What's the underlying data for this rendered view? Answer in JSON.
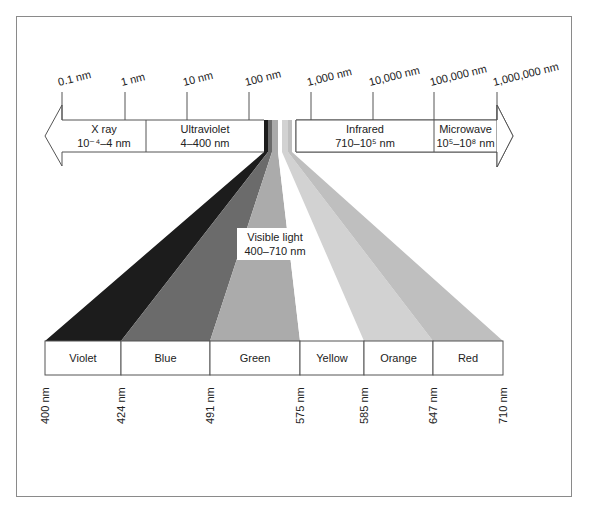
{
  "diagram": {
    "scale_ticks": [
      {
        "label": "0.1 nm",
        "x": 62
      },
      {
        "label": "1 nm",
        "x": 125
      },
      {
        "label": "10 nm",
        "x": 187
      },
      {
        "label": "100 nm",
        "x": 249
      },
      {
        "label": "1,000 nm",
        "x": 311
      },
      {
        "label": "10,000 nm",
        "x": 373
      },
      {
        "label": "100,000 nm",
        "x": 434
      },
      {
        "label": "1,000,000 nm",
        "x": 497
      }
    ],
    "bands": [
      {
        "name": "X ray",
        "range": "10⁻⁴–4 nm",
        "x0": 62,
        "x1": 146
      },
      {
        "name": "Ultraviolet",
        "range": "4–400 nm",
        "x0": 146,
        "x1": 264
      },
      {
        "name": "Infrared",
        "range": "710–10⁵ nm",
        "x0": 296,
        "x1": 434
      },
      {
        "name": "Microwave",
        "range": "10⁵–10⁸ nm",
        "x0": 434,
        "x1": 497
      }
    ],
    "visible_label": {
      "line1": "Visible light",
      "line2": "400–710 nm"
    },
    "colors": [
      {
        "name": "Violet",
        "from": "400 nm",
        "to": "424 nm",
        "fill": "#1c1c1c",
        "x0": 45,
        "x1": 121,
        "tx0": 264,
        "tx1": 268
      },
      {
        "name": "Blue",
        "from": "424 nm",
        "to": "491 nm",
        "fill": "#6b6b6b",
        "x0": 121,
        "x1": 210,
        "tx0": 268,
        "tx1": 272
      },
      {
        "name": "Green",
        "from": "491 nm",
        "to": "575 nm",
        "fill": "#ababab",
        "x0": 210,
        "x1": 300,
        "tx0": 272,
        "tx1": 278
      },
      {
        "name": "Yellow",
        "from": "575 nm",
        "to": "585 nm",
        "fill": "#ffffff",
        "x0": 300,
        "x1": 364,
        "tx0": 278,
        "tx1": 282
      },
      {
        "name": "Orange",
        "from": "585 nm",
        "to": "647 nm",
        "fill": "#d2d2d2",
        "x0": 364,
        "x1": 433,
        "tx0": 282,
        "tx1": 288
      },
      {
        "name": "Red",
        "from": "647 nm",
        "to": "710 nm",
        "fill": "#bfbfbf",
        "x0": 433,
        "x1": 503,
        "tx0": 288,
        "tx1": 292
      }
    ],
    "boundary_labels": [
      "400 nm",
      "424 nm",
      "491 nm",
      "575 nm",
      "585 nm",
      "647 nm",
      "710 nm"
    ]
  }
}
